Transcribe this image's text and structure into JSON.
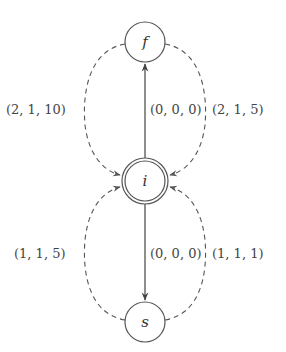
{
  "diagram": {
    "type": "state-graph",
    "nodes": [
      {
        "id": "f",
        "label": "f",
        "cx": 145,
        "cy": 42,
        "r": 20,
        "double": false
      },
      {
        "id": "i",
        "label": "i",
        "cx": 145,
        "cy": 181,
        "r": 22,
        "double": true
      },
      {
        "id": "s",
        "label": "s",
        "cx": 145,
        "cy": 322,
        "r": 20,
        "double": false
      }
    ],
    "edges": [
      {
        "from": "i",
        "to": "f",
        "style": "solid",
        "label": "(0,0,0)"
      },
      {
        "from": "i",
        "to": "s",
        "style": "solid",
        "label": "(0,0,0)"
      },
      {
        "from": "f",
        "to": "i",
        "side": "left",
        "style": "dashed",
        "label": "(2,1,10)"
      },
      {
        "from": "f",
        "to": "i",
        "side": "right",
        "style": "dashed",
        "label": "(2,1,5)"
      },
      {
        "from": "s",
        "to": "i",
        "side": "left",
        "style": "dashed",
        "label": "(1,1,5)"
      },
      {
        "from": "s",
        "to": "i",
        "side": "right",
        "style": "dashed",
        "label": "(1,1,1)"
      }
    ]
  },
  "labels": {
    "node_f": "f",
    "node_i": "i",
    "node_s": "s",
    "edge_i_f": "(0, 0, 0)",
    "edge_i_s": "(0, 0, 0)",
    "edge_f_i_left": "(2, 1, 10)",
    "edge_f_i_right": "(2, 1, 5)",
    "edge_s_i_left": "(1, 1, 5)",
    "edge_s_i_right": "(1, 1, 1)"
  },
  "colors": {
    "stroke": "#555555",
    "text": "#333333",
    "background": "#ffffff"
  }
}
